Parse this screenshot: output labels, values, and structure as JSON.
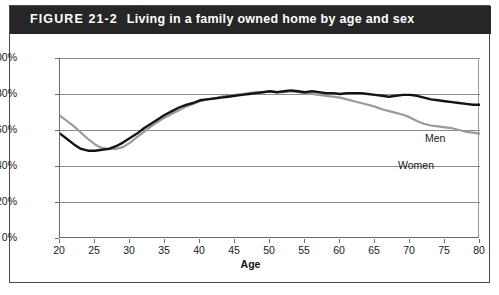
{
  "figure": {
    "number": "FIGURE 21-2",
    "caption": "Living in a family owned home by age and sex",
    "header_bg": "#262626",
    "header_text_color": "#ffffff"
  },
  "chart_data": {
    "type": "line",
    "title": "Living in a family owned home by age and sex",
    "xlabel": "Age",
    "ylabel": "",
    "xlim": [
      20,
      80
    ],
    "ylim": [
      0,
      100
    ],
    "grid": true,
    "legend_position": "inline-annotation",
    "xticks": [
      20,
      25,
      30,
      35,
      40,
      45,
      50,
      55,
      60,
      65,
      70,
      75,
      80
    ],
    "xtick_labels": [
      "20",
      "25",
      "30",
      "35",
      "40",
      "45",
      "50",
      "55",
      "60",
      "65",
      "70",
      "75",
      "80"
    ],
    "yticks": [
      0,
      20,
      40,
      60,
      80,
      100
    ],
    "ytick_labels": [
      "0%",
      "20%",
      "40%",
      "60%",
      "80%",
      "100%"
    ],
    "x": [
      20,
      21,
      22,
      23,
      24,
      25,
      26,
      27,
      28,
      29,
      30,
      31,
      32,
      33,
      34,
      35,
      36,
      37,
      38,
      39,
      40,
      41,
      42,
      43,
      44,
      45,
      46,
      47,
      48,
      49,
      50,
      51,
      52,
      53,
      54,
      55,
      56,
      57,
      58,
      59,
      60,
      61,
      62,
      63,
      64,
      65,
      66,
      67,
      68,
      69,
      70,
      71,
      72,
      73,
      74,
      75,
      76,
      77,
      78,
      79,
      80
    ],
    "series": [
      {
        "name": "Men",
        "color": "#141414",
        "values": [
          58,
          55,
          52,
          49.5,
          48.5,
          48.5,
          49,
          49.5,
          51,
          53,
          55.5,
          58,
          61,
          63.5,
          66,
          68.5,
          70.5,
          72.5,
          74,
          75,
          76.5,
          77,
          77.5,
          78,
          78.5,
          79,
          79.5,
          80,
          80.5,
          81,
          81.5,
          81,
          81.5,
          82,
          81.5,
          81,
          81.5,
          81,
          80.5,
          80.5,
          80,
          80.5,
          80.5,
          80.5,
          80,
          79.5,
          79,
          78.5,
          79,
          79.5,
          79.5,
          79,
          78,
          77,
          76.5,
          76,
          75.5,
          75,
          74.5,
          74,
          74
        ]
      },
      {
        "name": "Women",
        "color": "#9a9a9a",
        "values": [
          68,
          65,
          62,
          58.5,
          55,
          52,
          50,
          49.5,
          49.5,
          50.5,
          53,
          56,
          59,
          62,
          64.5,
          67,
          69,
          71,
          73,
          74.5,
          76,
          77,
          77.5,
          78.5,
          79,
          79.5,
          80,
          80.5,
          81,
          81,
          81.5,
          81,
          81,
          81.5,
          81,
          80.5,
          80,
          79.5,
          79,
          78.5,
          78,
          77,
          76,
          75,
          74,
          73,
          71.5,
          70.5,
          69.5,
          68.5,
          67,
          65,
          63.5,
          62.5,
          62,
          61.5,
          61,
          60,
          59,
          58.5,
          58
        ]
      }
    ],
    "annotations": [
      {
        "text": "Men",
        "x": 69,
        "y": 86
      },
      {
        "text": "Women",
        "x": 65,
        "y": 73
      }
    ]
  }
}
